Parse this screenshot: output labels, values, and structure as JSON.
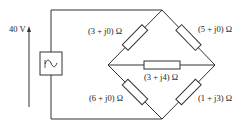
{
  "source": {
    "voltage_label": "40 V",
    "icon": "ac-source-tilde-icon"
  },
  "impedances": {
    "top_left": "(3 + j0) Ω",
    "top_right": "(5 + j0) Ω",
    "middle": "(3 + j4) Ω",
    "bottom_left": "(6 + j0) Ω",
    "bottom_right": "(1 + j3) Ω"
  },
  "colors": {
    "line": "#333333",
    "background": "#ffffff"
  }
}
